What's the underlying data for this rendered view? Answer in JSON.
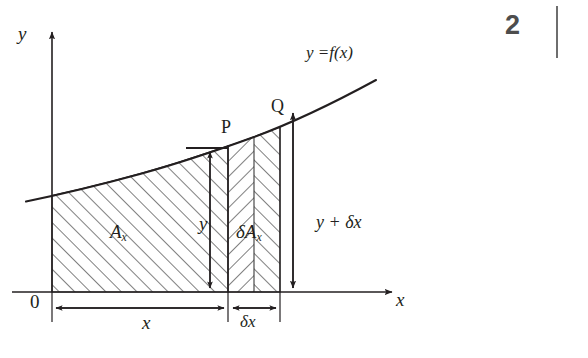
{
  "figure": {
    "caption_page_number": "2",
    "axes": {
      "y_axis_label": "y",
      "x_axis_label": "x",
      "origin_label": "0"
    },
    "curve": {
      "label_lhs": "y",
      "label_eq": "=",
      "label_rhs": "f(x)",
      "label_full": "y =f(x)"
    },
    "points": {
      "p_label": "P",
      "q_label": "Q"
    },
    "regions": {
      "area_symbol": "A",
      "area_subscript": "x",
      "delta_area_symbol": "δA",
      "delta_area_subscript": "x"
    },
    "dimensions": {
      "height_y": "y",
      "height_y_plus": "y + δx",
      "width_x": "x",
      "width_dx": "δx"
    },
    "colors": {
      "ink": "#231f20",
      "hatch": "#3a3a3a",
      "background": "#ffffff",
      "page_number": "#4d4d4d",
      "rule": "#6e6e6e"
    }
  }
}
